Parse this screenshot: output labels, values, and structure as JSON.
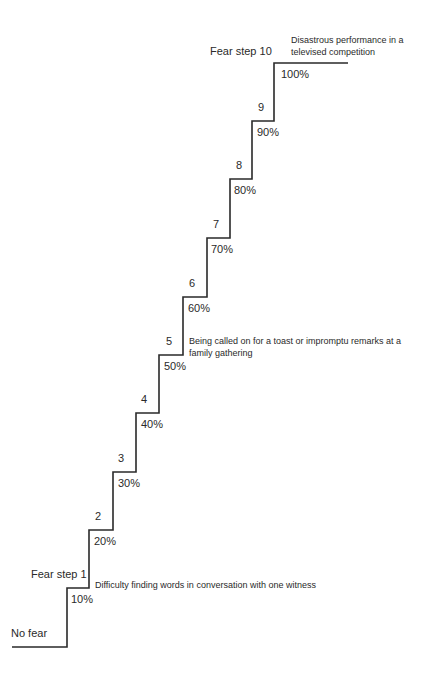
{
  "diagram": {
    "type": "fear-hierarchy-staircase",
    "start_label": "No fear",
    "line_color": "#2a2a2a",
    "steps": [
      {
        "step_label": "Fear step 1",
        "percent": "10%",
        "description": "Difficulty finding words in conversation with one witness"
      },
      {
        "step_label": "2",
        "percent": "20%"
      },
      {
        "step_label": "3",
        "percent": "30%"
      },
      {
        "step_label": "4",
        "percent": "40%"
      },
      {
        "step_label": "5",
        "percent": "50%",
        "description": "Being called on for a toast or impromptu remarks at a family gathering"
      },
      {
        "step_label": "6",
        "percent": "60%"
      },
      {
        "step_label": "7",
        "percent": "70%"
      },
      {
        "step_label": "8",
        "percent": "80%"
      },
      {
        "step_label": "9",
        "percent": "90%"
      },
      {
        "step_label": "Fear step 10",
        "percent": "100%",
        "description": "Disastrous performance in a televised competition"
      }
    ]
  }
}
